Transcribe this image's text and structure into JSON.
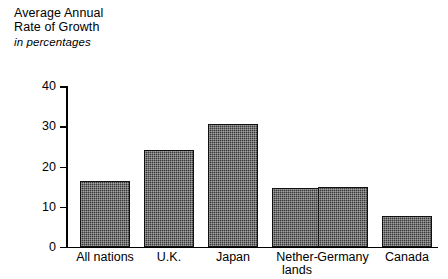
{
  "chart_data": {
    "type": "bar",
    "title": "Average Annual Rate of Growth",
    "title_lines": [
      "Average Annual",
      "Rate of Growth"
    ],
    "subtitle": "in percentages",
    "xlabel": "",
    "ylabel": "",
    "ylim": [
      0,
      40
    ],
    "yticks": [
      0,
      10,
      20,
      30,
      40
    ],
    "ytick_labels": [
      "0",
      "10",
      "20",
      "30",
      "40"
    ],
    "grid": false,
    "legend": false,
    "bar_color": "#3a3a3a",
    "categories": [
      "All nations",
      "U.K.",
      "Japan",
      "Netherlands",
      "Germany",
      "Canada"
    ],
    "category_label_lines": [
      [
        "All nations"
      ],
      [
        "U.K."
      ],
      [
        "Japan"
      ],
      [
        "Nether-",
        "lands"
      ],
      [
        "Germany"
      ],
      [
        "Canada"
      ]
    ],
    "values": [
      16.5,
      24.2,
      30.6,
      14.6,
      15.0,
      7.6
    ]
  }
}
